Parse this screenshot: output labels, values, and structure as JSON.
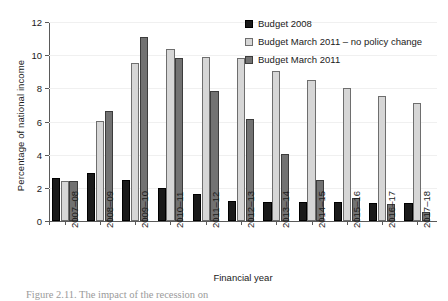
{
  "chart_data": {
    "type": "bar",
    "title": "",
    "xlabel": "Financial year",
    "ylabel": "Percentage of national income",
    "ylim": [
      0,
      12
    ],
    "yticks": [
      0,
      2,
      4,
      6,
      8,
      10,
      12
    ],
    "grid": true,
    "legend_position": "top-right",
    "categories": [
      "2007–08",
      "2008–09",
      "2009–10",
      "2010–11",
      "2011–12",
      "2012–13",
      "2013–14",
      "2014–15",
      "2015–16",
      "2016–17",
      "2017–18"
    ],
    "series": [
      {
        "name": "Budget 2008",
        "color": "#1a1a1a",
        "values": [
          2.6,
          2.9,
          2.5,
          2.0,
          1.6,
          1.2,
          1.15,
          1.15,
          1.15,
          1.1,
          1.1
        ]
      },
      {
        "name": "Budget March 2011 – no policy change",
        "color": "#d6d6d6",
        "values": [
          2.4,
          6.05,
          9.5,
          10.35,
          9.9,
          9.8,
          9.05,
          8.5,
          8.0,
          7.55,
          7.1
        ]
      },
      {
        "name": "Budget March 2011",
        "color": "#727272",
        "values": [
          2.4,
          6.65,
          11.1,
          9.85,
          7.85,
          6.15,
          4.05,
          2.45,
          1.4,
          1.0,
          0.55
        ]
      }
    ]
  },
  "caption": "Figure 2.11. The impact of the recession on"
}
